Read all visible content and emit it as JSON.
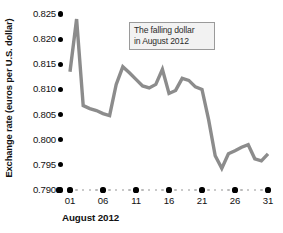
{
  "chart_data": {
    "type": "line",
    "title": "",
    "xlabel": "August 2012",
    "ylabel": "Exchange rate (euros per U.S. dollar)",
    "grid": false,
    "legend": "none",
    "line_color": "#8c8c8c",
    "axis_dot_color": "#000000",
    "minor_dot_color": "#b9b9b9",
    "xlim": [
      1,
      31
    ],
    "ylim": [
      0.79,
      0.825
    ],
    "y_ticks": [
      "0.825",
      "0.820",
      "0.815",
      "0.810",
      "0.805",
      "0.800",
      "0.795",
      "0.790"
    ],
    "y_tick_values": [
      0.825,
      0.82,
      0.815,
      0.81,
      0.805,
      0.8,
      0.795,
      0.79
    ],
    "x_ticks": [
      "01",
      "06",
      "11",
      "16",
      "21",
      "26",
      "31"
    ],
    "x_tick_values": [
      1,
      6,
      11,
      16,
      21,
      26,
      31
    ],
    "x": [
      1,
      2,
      3,
      4,
      5,
      6,
      7,
      8,
      9,
      10,
      11,
      12,
      13,
      14,
      15,
      16,
      17,
      18,
      19,
      20,
      21,
      22,
      23,
      24,
      25,
      26,
      27,
      28,
      29,
      30,
      31
    ],
    "values": [
      0.8135,
      0.824,
      0.8068,
      0.8062,
      0.8058,
      0.8052,
      0.8048,
      0.811,
      0.8145,
      0.8133,
      0.812,
      0.8107,
      0.8103,
      0.811,
      0.814,
      0.8092,
      0.8098,
      0.8122,
      0.8118,
      0.8105,
      0.81,
      0.804,
      0.7968,
      0.7943,
      0.7972,
      0.7978,
      0.7985,
      0.799,
      0.7962,
      0.7958,
      0.7972
    ],
    "annotation": {
      "line1": "The falling dollar",
      "line2": "in August 2012"
    }
  }
}
